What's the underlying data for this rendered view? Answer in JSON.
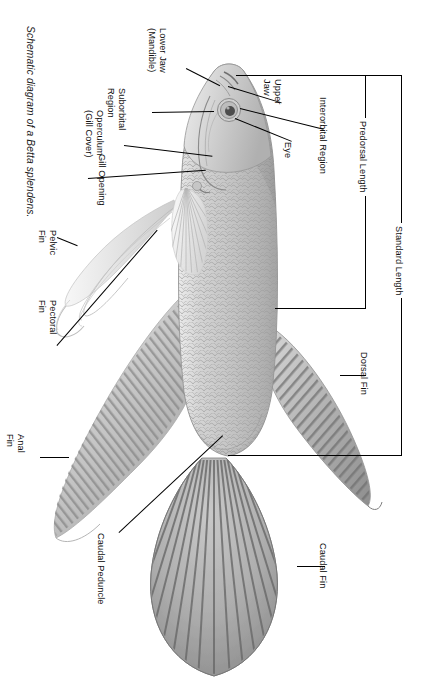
{
  "figure": {
    "caption": "Schematic diagram of a Betta splendens.",
    "subject": "Betta splendens",
    "orientation": "rotated-90",
    "background_color": "#ffffff",
    "line_color": "#000000",
    "text_color": "#111111"
  },
  "labels": {
    "lower_jaw": "Lower Jaw",
    "lower_jaw_alt": "(Mandible)",
    "upper_jaw_1": "Upper",
    "upper_jaw_2": "Jaw",
    "suborbital_1": "Suborbital",
    "suborbital_2": "Region",
    "operculum_1": "Operculum",
    "operculum_2": "(Gill Cover)",
    "gill_opening": "Gill Opening",
    "eye": "Eye",
    "interorbital_region": "Interorbital Region",
    "predorsal_length": "Predorsal Length",
    "standard_length": "Standard Length",
    "dorsal_fin": "Dorsal Fin",
    "pelvic_fin_1": "Pelvic",
    "pelvic_fin_2": "Fin",
    "pectoral_fin_1": "Pectoral",
    "pectoral_fin_2": "Fin",
    "anal_fin_1": "Anal",
    "anal_fin_2": "Fin",
    "caudal_fin": "Caudal Fin",
    "caudal_peduncle": "Caudal Peduncle"
  },
  "measurements": [
    {
      "name": "Standard Length",
      "kind": "bracket",
      "scope": "snout-to-caudal-peduncle"
    },
    {
      "name": "Predorsal Length",
      "kind": "bracket",
      "scope": "snout-to-dorsal-fin-origin"
    }
  ],
  "anatomy_parts": [
    "Lower Jaw (Mandible)",
    "Upper Jaw",
    "Suborbital Region",
    "Operculum (Gill Cover)",
    "Gill Opening",
    "Eye",
    "Interorbital Region",
    "Dorsal Fin",
    "Pelvic Fin",
    "Pectoral Fin",
    "Anal Fin",
    "Caudal Fin",
    "Caudal Peduncle"
  ]
}
